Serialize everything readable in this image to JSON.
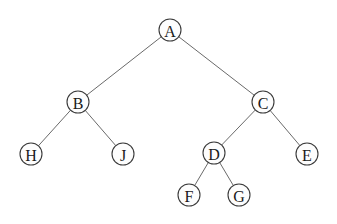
{
  "diagram": {
    "type": "binary-tree",
    "node_radius": 11,
    "colors": {
      "background": "#ffffff",
      "edge": "#6a6a6a",
      "node_fill": "#fdfdfd",
      "node_stroke": "#3a3a3a",
      "label": "#1a1a1a"
    },
    "nodes": [
      {
        "id": "A",
        "label": "A",
        "x": 170,
        "y": 30
      },
      {
        "id": "B",
        "label": "B",
        "x": 78,
        "y": 102
      },
      {
        "id": "C",
        "label": "C",
        "x": 263,
        "y": 102
      },
      {
        "id": "H",
        "label": "H",
        "x": 31,
        "y": 154
      },
      {
        "id": "J",
        "label": "J",
        "x": 123,
        "y": 154
      },
      {
        "id": "D",
        "label": "D",
        "x": 214,
        "y": 153
      },
      {
        "id": "E",
        "label": "E",
        "x": 307,
        "y": 154
      },
      {
        "id": "F",
        "label": "F",
        "x": 189,
        "y": 195
      },
      {
        "id": "G",
        "label": "G",
        "x": 239,
        "y": 195
      }
    ],
    "edges": [
      {
        "from": "A",
        "to": "B"
      },
      {
        "from": "A",
        "to": "C"
      },
      {
        "from": "B",
        "to": "H"
      },
      {
        "from": "B",
        "to": "J"
      },
      {
        "from": "C",
        "to": "D"
      },
      {
        "from": "C",
        "to": "E"
      },
      {
        "from": "D",
        "to": "F"
      },
      {
        "from": "D",
        "to": "G"
      }
    ]
  }
}
